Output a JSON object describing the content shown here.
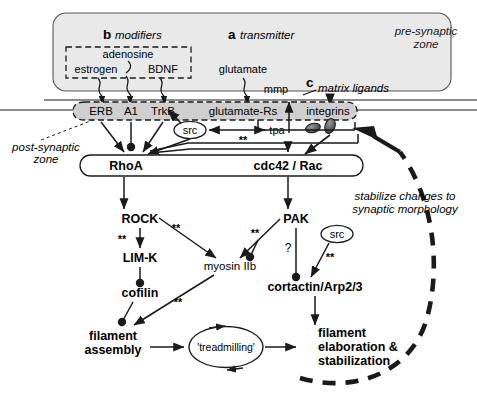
{
  "figure": {
    "zones": {
      "pre_synaptic": "pre-synaptic\nzone",
      "pre_synaptic_line1": "pre-synaptic",
      "pre_synaptic_line2": "zone",
      "post_synaptic_line1": "post-synaptic",
      "post_synaptic_line2": "zone"
    },
    "panel_letters": {
      "b": "b",
      "a": "a",
      "c": "c"
    },
    "panel_titles": {
      "modifiers": "modifiers",
      "transmitter": "transmitter",
      "matrix_ligands": "matrix ligands"
    },
    "ligands": {
      "estrogen": "estrogen",
      "adenosine": "adenosine",
      "bdnf": "BDNF",
      "glutamate": "glutamate",
      "mmp": "mmp"
    },
    "receptors": {
      "erb": "ERB",
      "a1": "A1",
      "trkb": "TrkB",
      "glutamate_rs": "glutamate-Rs",
      "integrins": "integrins"
    },
    "membrane_nodes": {
      "src_upper": "src",
      "tpa": "tpa"
    },
    "gtpases": {
      "rhoa": "RhoA",
      "cdc42_rac": "cdc42 / Rac"
    },
    "effectors": {
      "rock": "ROCK",
      "limk": "LIM-K",
      "cofilin": "cofilin",
      "myosin": "myosin IIb",
      "pak": "PAK",
      "src_lower": "src",
      "cortactin": "cortactin/Arp2/3"
    },
    "outcomes": {
      "filament_assembly_l1": "filament",
      "filament_assembly_l2": "assembly",
      "treadmilling": "'treadmilling'",
      "filament_elab_l1": "filament",
      "filament_elab_l2": "elaboration &",
      "filament_elab_l3": "stabilization"
    },
    "annotations": {
      "stabilize_l1": "stabilize changes to",
      "stabilize_l2": "synaptic morphology",
      "star_rock_myosin": "**",
      "star_rock_limk": "**",
      "star_cofilin": "**",
      "star_pak_myosin": "**",
      "star_src_cortactin": "**",
      "star_membrane": "**",
      "question_pak": "?"
    },
    "colors": {
      "zone_fill": "#e8e8e8",
      "membrane_fill": "#d0d0d0",
      "stroke": "#1a1a1a",
      "text": "#000000",
      "vesicle_fill": "#4a4a4a"
    }
  }
}
